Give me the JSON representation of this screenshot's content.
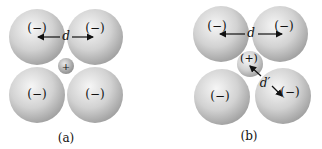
{
  "panels": [
    {
      "caption": "(a)",
      "anions": [
        {
          "cx": 37,
          "cy": 37,
          "r": 28,
          "label": "(−)"
        },
        {
          "cx": 95,
          "cy": 37,
          "r": 28,
          "label": "(−)"
        },
        {
          "cx": 37,
          "cy": 95,
          "r": 28,
          "label": "(−)"
        },
        {
          "cx": 95,
          "cy": 95,
          "r": 28,
          "label": "(−)"
        }
      ],
      "cation": {
        "cx": 66,
        "cy": 66,
        "r": 8,
        "label": "+"
      },
      "distance_label": "d"
    },
    {
      "caption": "(b)",
      "anions": [
        {
          "cx": 221,
          "cy": 34,
          "r": 28,
          "label": "(−)"
        },
        {
          "cx": 280,
          "cy": 34,
          "r": 28,
          "label": "(−)"
        },
        {
          "cx": 222,
          "cy": 97,
          "r": 28,
          "label": "(−)"
        },
        {
          "cx": 283,
          "cy": 96,
          "r": 28,
          "label": "(−)"
        }
      ],
      "cation": {
        "cx": 250,
        "cy": 64,
        "r": 13,
        "label": "(+)"
      },
      "distance_label": "d",
      "cation_distance_label": "d′"
    }
  ],
  "colors": {
    "sphere_light": "#f4f4f4",
    "sphere_dark": "#9a9a9a",
    "text": "#111111"
  }
}
